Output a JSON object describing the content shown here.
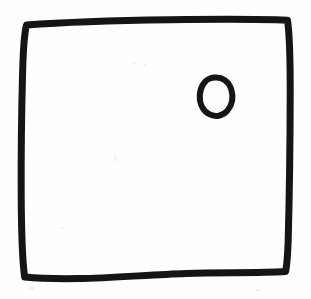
{
  "image": {
    "kind": "hand-drawn-sketch",
    "medium": "black marker on white paper",
    "width": 311,
    "height": 299,
    "background_color": "#fefefe",
    "ink_color": "#151515",
    "alt_text": "A hand-drawn square outline with a small hand-drawn circle inside the upper-right area",
    "caption": ""
  },
  "shapes": [
    {
      "id": "outer-square",
      "name": "square-outline",
      "label": "Square",
      "role": "container",
      "stroke_color": "#151515",
      "stroke_width": 7,
      "fill": "none",
      "closed": true,
      "bounds": {
        "x": 21,
        "y": 20,
        "width": 270,
        "height": 259
      },
      "corners": {
        "top_left": [
          26,
          24
        ],
        "top_right": [
          288,
          20
        ],
        "bottom_right": [
          285,
          271
        ],
        "bottom_left": [
          24,
          276
        ]
      },
      "path": "M 26.5 25 C 60 22.5, 120 20.5, 170 19.8 C 215 19.2, 258 19.0, 287.5 20.3 C 289.6 34, 290.3 60, 290.2 96 C 290.1 140, 289.4 196, 288.2 240 C 287.6 256, 286.8 266, 285.6 271.5 C 258 273.2, 222 272.2, 186 273.4 C 150 274.6, 112 278.2, 78 278.6 C 55 278.9, 36 278.2, 24.6 277.0 C 22.6 262, 21.4 232, 21.2 196 C 21.0 156, 21.6 110, 22.6 72 C 23.2 50, 24.2 34, 26.5 25 Z"
    },
    {
      "id": "small-circle",
      "name": "circle-mark",
      "label": "Circle",
      "role": "mark",
      "stroke_color": "#151515",
      "stroke_width": 6,
      "fill": "none",
      "closed": true,
      "bounds": {
        "x": 200,
        "y": 76,
        "width": 33,
        "height": 41
      },
      "center": [
        216,
        96
      ],
      "radius_x": 14,
      "radius_y": 18,
      "rotation_deg": -12,
      "path": "M 214.5 77.5 C 222 76.6, 228.8 81.5, 231.2 89.2 C 233.6 97.0, 232.2 105.0, 227.4 110.6 C 222.6 116.2, 215.2 117.4, 209.2 114.2 C 203.0 110.9, 199.4 103.6, 199.8 95.4 C 200.2 87.0, 204.4 80.0, 211.0 78.0 Z"
    }
  ],
  "annotations": {
    "count_shapes": 2,
    "text_labels": []
  }
}
